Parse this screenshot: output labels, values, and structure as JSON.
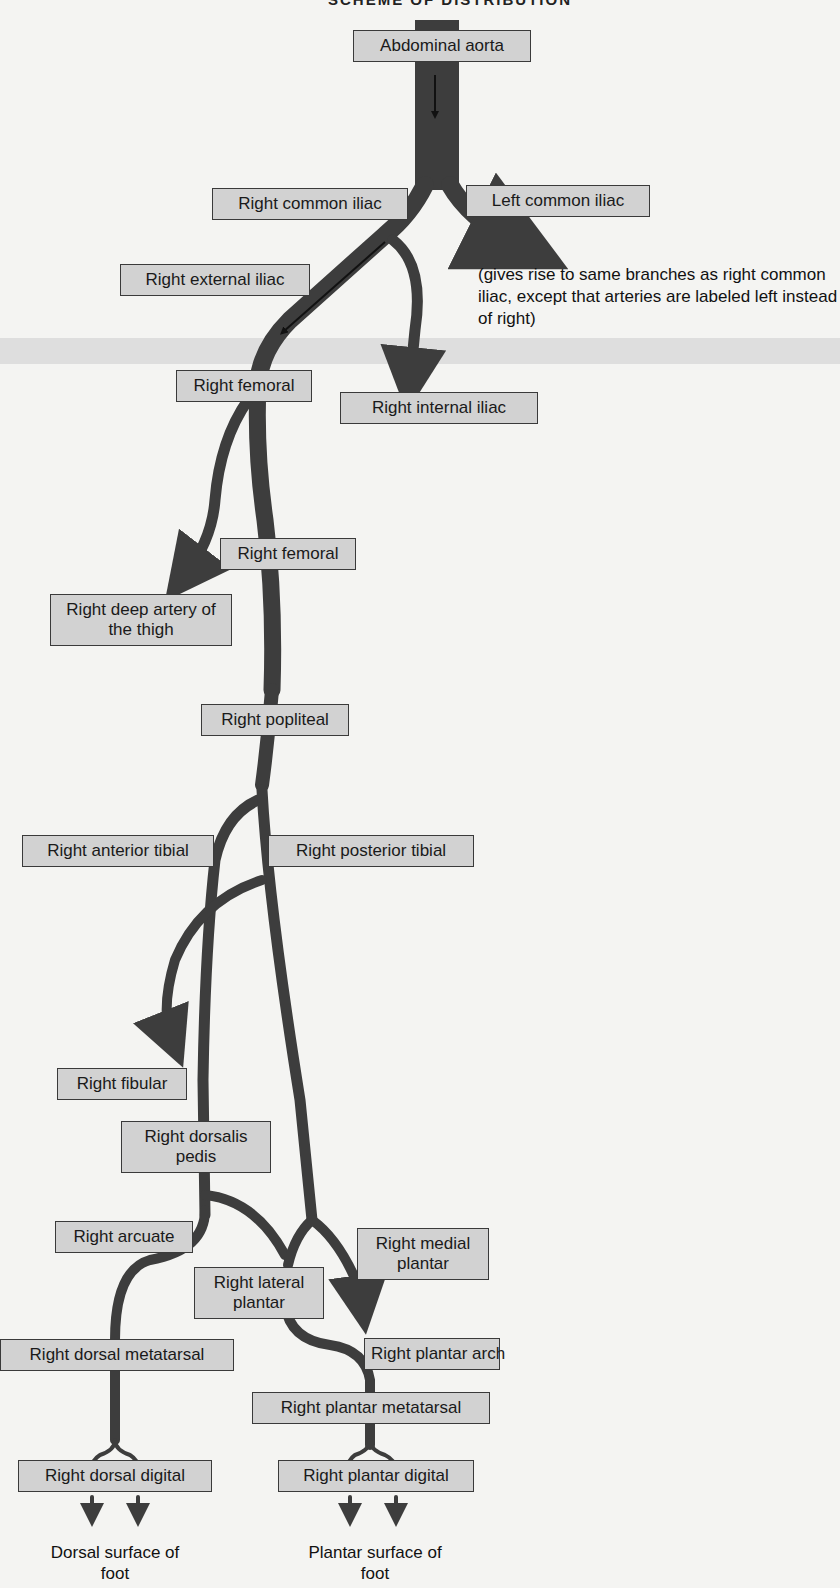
{
  "heading": "SCHEME OF DISTRIBUTION",
  "colors": {
    "vessel": "#3d3d3d",
    "label_bg": "#d2d2d2",
    "label_border": "#3a3a3a",
    "page_bg": "#f4f4f2"
  },
  "labels": {
    "abdominal_aorta": "Abdominal aorta",
    "right_common_iliac": "Right common iliac",
    "left_common_iliac": "Left common iliac",
    "right_external_iliac": "Right external iliac",
    "right_femoral_1": "Right femoral",
    "right_internal_iliac": "Right internal iliac",
    "right_femoral_2": "Right femoral",
    "right_deep_artery_thigh": "Right deep artery of the thigh",
    "right_popliteal": "Right popliteal",
    "right_anterior_tibial": "Right anterior tibial",
    "right_posterior_tibial": "Right posterior tibial",
    "right_fibular": "Right fibular",
    "right_dorsalis_pedis": "Right dorsalis pedis",
    "right_arcuate": "Right arcuate",
    "right_medial_plantar": "Right medial plantar",
    "right_lateral_plantar": "Right lateral plantar",
    "right_dorsal_metatarsal": "Right dorsal metatarsal",
    "right_plantar_arch": "Right plantar arch",
    "right_plantar_metatarsal": "Right plantar metatarsal",
    "right_dorsal_digital": "Right dorsal digital",
    "right_plantar_digital": "Right plantar digital"
  },
  "notes": {
    "left_side": "(gives rise to same branches as right common iliac, except that arteries are labeled left instead of right)"
  },
  "captions": {
    "dorsal_surface": "Dorsal surface of foot",
    "plantar_surface": "Plantar surface of foot"
  }
}
